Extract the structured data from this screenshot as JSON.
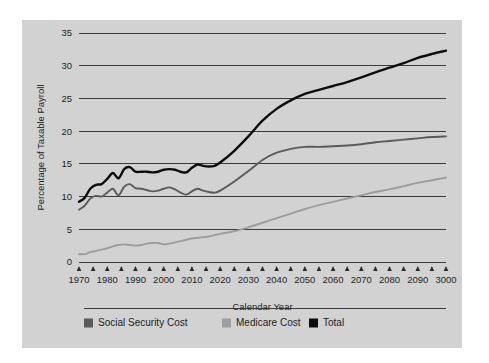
{
  "figure": {
    "background_color": "#d2d2d2",
    "page_color": "#ffffff"
  },
  "chart_data": {
    "type": "line",
    "title": "",
    "subtitle": "",
    "xlabel": "Calendar Year",
    "ylabel": "Percentage of Taxable Payroll",
    "xlim": [
      1970,
      2100
    ],
    "ylim": [
      0,
      35
    ],
    "grid": true,
    "grid_axis": "y",
    "legend_position": "bottom",
    "y_ticks": [
      0,
      5,
      10,
      15,
      20,
      25,
      30,
      35
    ],
    "y_tick_labels": [
      "0",
      "5",
      "10",
      "15",
      "20",
      "25",
      "30",
      "35"
    ],
    "x_ticks": [
      1970,
      1975,
      1980,
      1985,
      1990,
      1995,
      2000,
      2005,
      2010,
      2015,
      2020,
      2025,
      2030,
      2035,
      2040,
      2045,
      2050,
      2055,
      2060,
      2065,
      2070,
      2075,
      2080,
      2085,
      2090,
      2095,
      2100
    ],
    "x_tick_labels": [
      "1970",
      "1980",
      "1990",
      "2000",
      "2010",
      "2020",
      "2030",
      "2040",
      "2050",
      "2060",
      "2070",
      "2080",
      "2090",
      "3000"
    ],
    "x_tick_label_values": [
      1970,
      1980,
      1990,
      2000,
      2010,
      2020,
      2030,
      2040,
      2050,
      2060,
      2070,
      2080,
      2090,
      2100
    ],
    "x": [
      1970,
      1972,
      1974,
      1976,
      1978,
      1980,
      1982,
      1984,
      1986,
      1988,
      1990,
      1992,
      1994,
      1996,
      1998,
      2000,
      2002,
      2004,
      2006,
      2008,
      2010,
      2012,
      2014,
      2016,
      2018,
      2020,
      2025,
      2030,
      2035,
      2040,
      2045,
      2050,
      2055,
      2060,
      2065,
      2070,
      2075,
      2080,
      2085,
      2090,
      2095,
      2100
    ],
    "series": [
      {
        "name": "Social Security Cost",
        "color": "#5a5a5a",
        "values": [
          8.0,
          8.6,
          9.7,
          10.1,
          10.0,
          10.6,
          11.2,
          10.2,
          11.5,
          11.9,
          11.3,
          11.2,
          11.0,
          10.8,
          10.9,
          11.2,
          11.4,
          11.1,
          10.6,
          10.3,
          10.8,
          11.2,
          10.9,
          10.7,
          10.6,
          10.9,
          12.3,
          13.9,
          15.6,
          16.7,
          17.3,
          17.6,
          17.6,
          17.7,
          17.8,
          18.0,
          18.3,
          18.5,
          18.7,
          18.9,
          19.1,
          19.2
        ]
      },
      {
        "name": "Medicare Cost",
        "color": "#9d9d9d",
        "values": [
          1.2,
          1.2,
          1.5,
          1.7,
          1.9,
          2.1,
          2.4,
          2.6,
          2.7,
          2.6,
          2.5,
          2.6,
          2.8,
          2.9,
          2.9,
          2.7,
          2.8,
          3.0,
          3.2,
          3.4,
          3.6,
          3.7,
          3.8,
          3.9,
          4.1,
          4.3,
          4.7,
          5.3,
          6.0,
          6.7,
          7.4,
          8.1,
          8.7,
          9.2,
          9.7,
          10.2,
          10.7,
          11.1,
          11.6,
          12.1,
          12.5,
          12.9
        ]
      },
      {
        "name": "Total",
        "color": "#0d0d0d",
        "values": [
          9.2,
          9.8,
          11.2,
          11.8,
          11.9,
          12.7,
          13.6,
          12.8,
          14.2,
          14.5,
          13.8,
          13.8,
          13.8,
          13.7,
          13.8,
          14.1,
          14.2,
          14.1,
          13.8,
          13.7,
          14.4,
          14.9,
          14.7,
          14.6,
          14.7,
          15.2,
          17.0,
          19.2,
          21.6,
          23.4,
          24.7,
          25.7,
          26.3,
          26.9,
          27.5,
          28.2,
          29.0,
          29.7,
          30.4,
          31.2,
          31.8,
          32.3
        ]
      }
    ]
  },
  "legend": {
    "items": [
      {
        "label": "Social Security Cost",
        "color": "#5a5a5a"
      },
      {
        "label": "Medicare Cost",
        "color": "#9d9d9d"
      },
      {
        "label": "Total",
        "color": "#0d0d0d"
      }
    ]
  }
}
